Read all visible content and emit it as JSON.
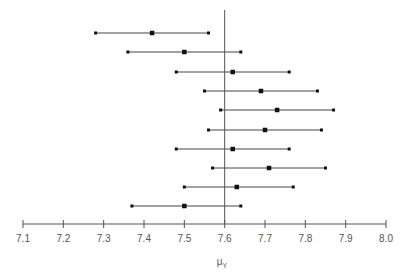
{
  "chart_data": {
    "type": "interval",
    "title": "",
    "xlabel": "μ_Y",
    "xlabel_main": "μ",
    "xlabel_sub": "Y",
    "ylabel": "",
    "xlim": [
      7.1,
      8.0
    ],
    "x_ticks": [
      "7.1",
      "7.2",
      "7.3",
      "7.4",
      "7.5",
      "7.6",
      "7.7",
      "7.8",
      "7.9",
      "8.0"
    ],
    "reference_line": 7.6,
    "grid": false,
    "intervals": [
      {
        "low": 7.28,
        "mean": 7.42,
        "high": 7.56
      },
      {
        "low": 7.36,
        "mean": 7.5,
        "high": 7.64
      },
      {
        "low": 7.48,
        "mean": 7.62,
        "high": 7.76
      },
      {
        "low": 7.55,
        "mean": 7.69,
        "high": 7.83
      },
      {
        "low": 7.59,
        "mean": 7.73,
        "high": 7.87
      },
      {
        "low": 7.56,
        "mean": 7.7,
        "high": 7.84
      },
      {
        "low": 7.48,
        "mean": 7.62,
        "high": 7.76
      },
      {
        "low": 7.57,
        "mean": 7.71,
        "high": 7.85
      },
      {
        "low": 7.5,
        "mean": 7.63,
        "high": 7.77
      },
      {
        "low": 7.37,
        "mean": 7.5,
        "high": 7.64
      }
    ]
  },
  "colors": {
    "line": "#333333",
    "axis": "#555555",
    "ref": "#555555"
  }
}
